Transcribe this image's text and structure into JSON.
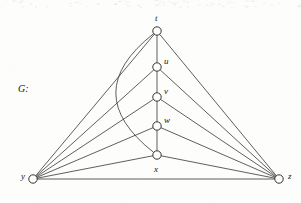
{
  "figure": {
    "name_label": "G:",
    "background_color": "#fdfdfc",
    "ink_color": "#2a2a2a"
  },
  "chart_data": {
    "type": "diagram",
    "diagram_kind": "undirected-graph",
    "title": "G:",
    "vertices": [
      {
        "id": "t",
        "label": "t",
        "x": 157,
        "y": 31,
        "label_x": 155,
        "label_y": 14,
        "label_pos": "above"
      },
      {
        "id": "u",
        "label": "u",
        "x": 157,
        "y": 67,
        "label_x": 164,
        "label_y": 57,
        "label_pos": "upper-right"
      },
      {
        "id": "v",
        "label": "v",
        "x": 157,
        "y": 97,
        "label_x": 164,
        "label_y": 87,
        "label_pos": "upper-right"
      },
      {
        "id": "w",
        "label": "w",
        "x": 157,
        "y": 126,
        "label_x": 164,
        "label_y": 116,
        "label_pos": "upper-right"
      },
      {
        "id": "x",
        "label": "x",
        "x": 157,
        "y": 155,
        "label_x": 154,
        "label_y": 165,
        "label_pos": "below"
      },
      {
        "id": "y",
        "label": "y",
        "x": 33,
        "y": 179,
        "label_x": 21,
        "label_y": 172,
        "label_pos": "left"
      },
      {
        "id": "z",
        "label": "z",
        "x": 279,
        "y": 179,
        "label_x": 288,
        "label_y": 172,
        "label_pos": "right"
      }
    ],
    "vertex_radius": 4.2,
    "edges": [
      {
        "from": "t",
        "to": "u",
        "shape": "line"
      },
      {
        "from": "u",
        "to": "v",
        "shape": "line"
      },
      {
        "from": "v",
        "to": "w",
        "shape": "line"
      },
      {
        "from": "w",
        "to": "x",
        "shape": "line"
      },
      {
        "from": "t",
        "to": "x",
        "shape": "curve",
        "control_x": 78,
        "control_y": 93
      },
      {
        "from": "t",
        "to": "y",
        "shape": "line"
      },
      {
        "from": "u",
        "to": "y",
        "shape": "line"
      },
      {
        "from": "v",
        "to": "y",
        "shape": "line"
      },
      {
        "from": "w",
        "to": "y",
        "shape": "line"
      },
      {
        "from": "x",
        "to": "y",
        "shape": "line"
      },
      {
        "from": "t",
        "to": "z",
        "shape": "line"
      },
      {
        "from": "u",
        "to": "z",
        "shape": "line"
      },
      {
        "from": "v",
        "to": "z",
        "shape": "line"
      },
      {
        "from": "w",
        "to": "z",
        "shape": "line"
      },
      {
        "from": "x",
        "to": "z",
        "shape": "line"
      },
      {
        "from": "y",
        "to": "z",
        "shape": "line"
      }
    ],
    "vertex_count": 7,
    "edge_count": 16,
    "xlabel": "",
    "ylabel": "",
    "grid": false,
    "legend": false
  }
}
